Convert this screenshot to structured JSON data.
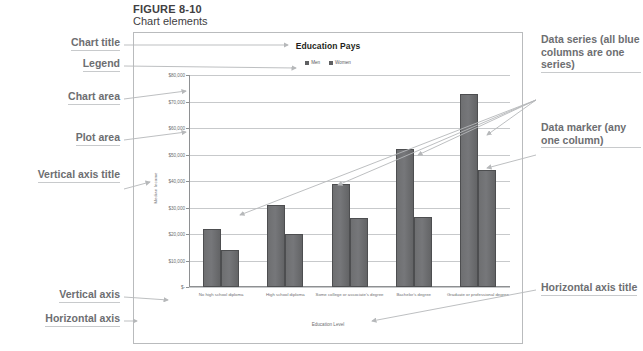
{
  "figure": {
    "number": "FIGURE 8-10",
    "title": "Chart elements"
  },
  "annotations": {
    "chart_title": "Chart title",
    "legend": "Legend",
    "chart_area": "Chart area",
    "plot_area": "Plot area",
    "vertical_axis_title": "Vertical axis title",
    "vertical_axis": "Vertical axis",
    "horizontal_axis": "Horizontal axis",
    "data_series": "Data series (all blue columns are one series)",
    "data_marker": "Data marker (any one column)",
    "horizontal_axis_title": "Horizontal axis title"
  },
  "colors": {
    "bar": "#6e6f71",
    "bar_border": "#4d4e50",
    "grid": "#c7c9cb",
    "axis": "#8e9092",
    "annotation_text": "#6d6e71",
    "frame": "#b9bbbd",
    "leader": "#b6b8ba"
  },
  "chart_data": {
    "type": "bar",
    "title": "Education Pays",
    "xlabel": "Education Level",
    "ylabel": "Median Income",
    "categories": [
      "No high school diploma",
      "High school diploma",
      "Some college or associate's degree",
      "Bachelor's degree",
      "Graduate or professional degree"
    ],
    "series": [
      {
        "name": "Men",
        "values": [
          22000,
          31000,
          39000,
          52000,
          73000
        ]
      },
      {
        "name": "Women",
        "values": [
          14000,
          20000,
          26000,
          26500,
          44000
        ]
      }
    ],
    "ylim": [
      0,
      80000
    ],
    "ytick_values": [
      0,
      10000,
      20000,
      30000,
      40000,
      50000,
      60000,
      70000,
      80000
    ],
    "ytick_labels": [
      "$-",
      "$10,000",
      "$20,000",
      "$30,000",
      "$40,000",
      "$50,000",
      "$60,000",
      "$70,000",
      "$80,000"
    ],
    "grid": true,
    "legend_position": "top"
  }
}
